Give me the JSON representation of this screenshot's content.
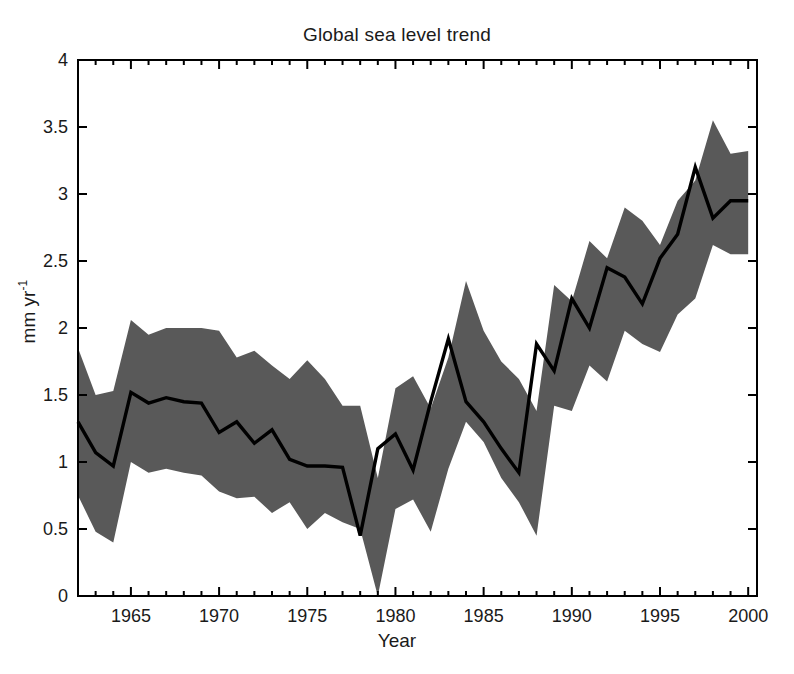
{
  "chart_data": {
    "type": "line",
    "title": "Global sea level trend",
    "xlabel": "Year",
    "ylabel": "mm yr⁻¹",
    "ylabel_base": "mm yr",
    "ylabel_exponent": "-1",
    "xlim": [
      1962,
      2000.5
    ],
    "ylim": [
      0,
      4
    ],
    "xticks": [
      1965,
      1970,
      1975,
      1980,
      1985,
      1990,
      1995,
      2000
    ],
    "xtick_labels": [
      "1965",
      "1970",
      "1975",
      "1980",
      "1985",
      "1990",
      "1995",
      "2000"
    ],
    "yticks": [
      0,
      0.5,
      1,
      1.5,
      2,
      2.5,
      3,
      3.5,
      4
    ],
    "ytick_labels": [
      "0",
      "0.5",
      "1",
      "1.5",
      "2",
      "2.5",
      "3",
      "3.5",
      "4"
    ],
    "grid": false,
    "legend": "none",
    "band_color": "#595959",
    "line_color": "#000000",
    "axis_color": "#000000",
    "x": [
      1962,
      1963,
      1964,
      1965,
      1966,
      1967,
      1968,
      1969,
      1970,
      1971,
      1972,
      1973,
      1974,
      1975,
      1976,
      1977,
      1978,
      1979,
      1980,
      1981,
      1982,
      1983,
      1984,
      1985,
      1986,
      1987,
      1988,
      1989,
      1990,
      1991,
      1992,
      1993,
      1994,
      1995,
      1996,
      1997,
      1998,
      1999,
      2000
    ],
    "series": [
      {
        "name": "Global sea level trend (central estimate)",
        "values": [
          1.3,
          1.07,
          0.97,
          1.52,
          1.44,
          1.48,
          1.45,
          1.44,
          1.22,
          1.3,
          1.14,
          1.24,
          1.02,
          0.97,
          0.97,
          0.96,
          0.45,
          1.1,
          1.21,
          0.94,
          1.45,
          1.92,
          1.45,
          1.3,
          1.1,
          0.92,
          1.88,
          1.68,
          2.22,
          2.0,
          2.45,
          2.38,
          2.18,
          2.52,
          2.7,
          3.2,
          2.82,
          2.95,
          2.95
        ]
      },
      {
        "name": "Upper uncertainty bound",
        "values": [
          1.85,
          1.5,
          1.53,
          2.06,
          1.95,
          2.0,
          2.0,
          2.0,
          1.98,
          1.78,
          1.83,
          1.72,
          1.62,
          1.76,
          1.62,
          1.42,
          1.42,
          0.88,
          1.55,
          1.64,
          1.4,
          1.78,
          2.35,
          1.98,
          1.75,
          1.62,
          1.38,
          2.32,
          2.2,
          2.65,
          2.52,
          2.9,
          2.8,
          2.62,
          2.95,
          3.1,
          3.55,
          3.3,
          3.32
        ]
      },
      {
        "name": "Lower uncertainty bound",
        "values": [
          0.75,
          0.48,
          0.4,
          1.0,
          0.92,
          0.95,
          0.92,
          0.9,
          0.78,
          0.73,
          0.74,
          0.62,
          0.7,
          0.5,
          0.62,
          0.55,
          0.5,
          0.0,
          0.65,
          0.72,
          0.48,
          0.95,
          1.3,
          1.15,
          0.88,
          0.7,
          0.45,
          1.42,
          1.38,
          1.72,
          1.6,
          1.98,
          1.88,
          1.82,
          2.1,
          2.22,
          2.62,
          2.55,
          2.55
        ]
      }
    ],
    "annotations": []
  }
}
